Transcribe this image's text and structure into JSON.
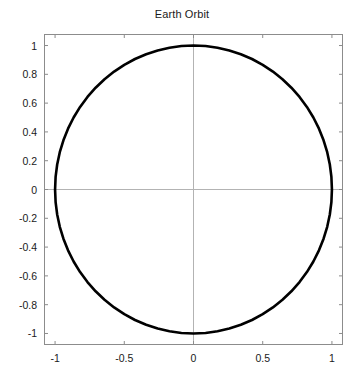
{
  "chart_data": {
    "type": "line",
    "title": "Earth Orbit",
    "xlabel": "",
    "ylabel": "",
    "xlim": [
      -1.08,
      1.08
    ],
    "ylim": [
      -1.08,
      1.08
    ],
    "grid": true,
    "grid_style": "zero-axis-crosshair",
    "legend": null,
    "aspect": "equal",
    "background_color": "#ffffff",
    "axes_color": "#8c8c8c",
    "gridline_color": "#b3b3b3",
    "xticks": [
      -1,
      -0.5,
      0,
      0.5,
      1
    ],
    "xtick_labels": [
      "-1",
      "-0.5",
      "0",
      "0.5",
      "1"
    ],
    "yticks": [
      -1,
      -0.8,
      -0.6,
      -0.4,
      -0.2,
      0,
      0.2,
      0.4,
      0.6,
      0.8,
      1
    ],
    "ytick_labels": [
      "-1",
      "-0.8",
      "-0.6",
      "-0.4",
      "-0.2",
      "0",
      "0.2",
      "0.4",
      "0.6",
      "0.8",
      "1"
    ],
    "series": [
      {
        "name": "Earth Orbit",
        "color": "#000000",
        "line_width": 2.6,
        "closed": true,
        "shape": "circle",
        "center": [
          0,
          0
        ],
        "radius": 1,
        "n_points": 72,
        "x": [
          1.0,
          0.9962,
          0.9848,
          0.9659,
          0.9397,
          0.9063,
          0.866,
          0.8192,
          0.766,
          0.7071,
          0.6428,
          0.5736,
          0.5,
          0.4226,
          0.342,
          0.2588,
          0.1736,
          0.0872,
          0.0,
          -0.0872,
          -0.1736,
          -0.2588,
          -0.342,
          -0.4226,
          -0.5,
          -0.5736,
          -0.6428,
          -0.7071,
          -0.766,
          -0.8192,
          -0.866,
          -0.9063,
          -0.9397,
          -0.9659,
          -0.9848,
          -0.9962,
          -1.0,
          -0.9962,
          -0.9848,
          -0.9659,
          -0.9397,
          -0.9063,
          -0.866,
          -0.8192,
          -0.766,
          -0.7071,
          -0.6428,
          -0.5736,
          -0.5,
          -0.4226,
          -0.342,
          -0.2588,
          -0.1736,
          -0.0872,
          0.0,
          0.0872,
          0.1736,
          0.2588,
          0.342,
          0.4226,
          0.5,
          0.5736,
          0.6428,
          0.7071,
          0.766,
          0.8192,
          0.866,
          0.9063,
          0.9397,
          0.9659,
          0.9848,
          0.9962,
          1.0
        ],
        "y": [
          0.0,
          0.0872,
          0.1736,
          0.2588,
          0.342,
          0.4226,
          0.5,
          0.5736,
          0.6428,
          0.7071,
          0.766,
          0.8192,
          0.866,
          0.9063,
          0.9397,
          0.9659,
          0.9848,
          0.9962,
          1.0,
          0.9962,
          0.9848,
          0.9659,
          0.9397,
          0.9063,
          0.866,
          0.8192,
          0.766,
          0.7071,
          0.6428,
          0.5736,
          0.5,
          0.4226,
          0.342,
          0.2588,
          0.1736,
          0.0872,
          0.0,
          -0.0872,
          -0.1736,
          -0.2588,
          -0.342,
          -0.4226,
          -0.5,
          -0.5736,
          -0.6428,
          -0.7071,
          -0.766,
          -0.8192,
          -0.866,
          -0.9063,
          -0.9397,
          -0.9659,
          -0.9848,
          -0.9962,
          -1.0,
          -0.9962,
          -0.9848,
          -0.9659,
          -0.9397,
          -0.9063,
          -0.866,
          -0.8192,
          -0.766,
          -0.7071,
          -0.6428,
          -0.5736,
          -0.5,
          -0.4226,
          -0.342,
          -0.2588,
          -0.1736,
          -0.0872,
          0.0
        ]
      }
    ]
  }
}
